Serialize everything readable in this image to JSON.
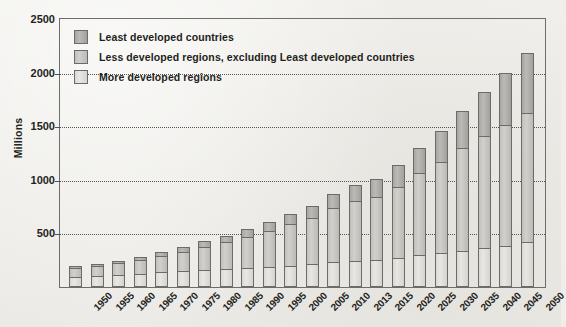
{
  "chart_data": {
    "type": "bar",
    "stacked": true,
    "title": "",
    "xlabel": "",
    "ylabel": "Millions",
    "ylim": [
      0,
      2500
    ],
    "ytick_values": [
      0,
      500,
      1000,
      1500,
      2000,
      2500
    ],
    "ytick_labels": [
      "",
      "500",
      "1000",
      "1500",
      "2000",
      "2500"
    ],
    "grid": "horizontal-dotted",
    "legend_position": "top-left",
    "categories": [
      "1950",
      "1955",
      "1960",
      "1965",
      "1970",
      "1975",
      "1980",
      "1985",
      "1990",
      "1995",
      "2000",
      "2005",
      "2010",
      "2013",
      "2015",
      "2020",
      "2025",
      "2030",
      "2035",
      "2040",
      "2045",
      "2050"
    ],
    "series": [
      {
        "name": "More developed regions",
        "color": "#e2e0dc",
        "values": [
          95,
          105,
          115,
          125,
          140,
          150,
          160,
          170,
          180,
          190,
          200,
          215,
          230,
          240,
          250,
          275,
          300,
          320,
          340,
          360,
          385,
          420
        ]
      },
      {
        "name": "Less developed regions, excluding Least developed countries",
        "color": "#c8c6c2",
        "values": [
          80,
          90,
          105,
          125,
          150,
          180,
          215,
          250,
          290,
          330,
          385,
          430,
          505,
          560,
          590,
          660,
          760,
          850,
          960,
          1050,
          1130,
          1200
        ]
      },
      {
        "name": "Least developed countries",
        "color": "#aeaca8",
        "values": [
          20,
          22,
          25,
          30,
          35,
          42,
          50,
          58,
          70,
          85,
          100,
          115,
          135,
          150,
          165,
          200,
          240,
          290,
          345,
          410,
          480,
          560
        ]
      }
    ],
    "totals": [
      195,
      217,
      245,
      280,
      325,
      372,
      425,
      478,
      540,
      605,
      685,
      760,
      870,
      950,
      1005,
      1135,
      1300,
      1460,
      1645,
      1820,
      1995,
      2180
    ]
  },
  "legend": {
    "items": [
      {
        "label": "Least developed countries",
        "swatch": "s-least"
      },
      {
        "label": "Less developed regions, excluding Least developed countries",
        "swatch": "s-less"
      },
      {
        "label": "More developed regions",
        "swatch": "s-more"
      }
    ]
  }
}
